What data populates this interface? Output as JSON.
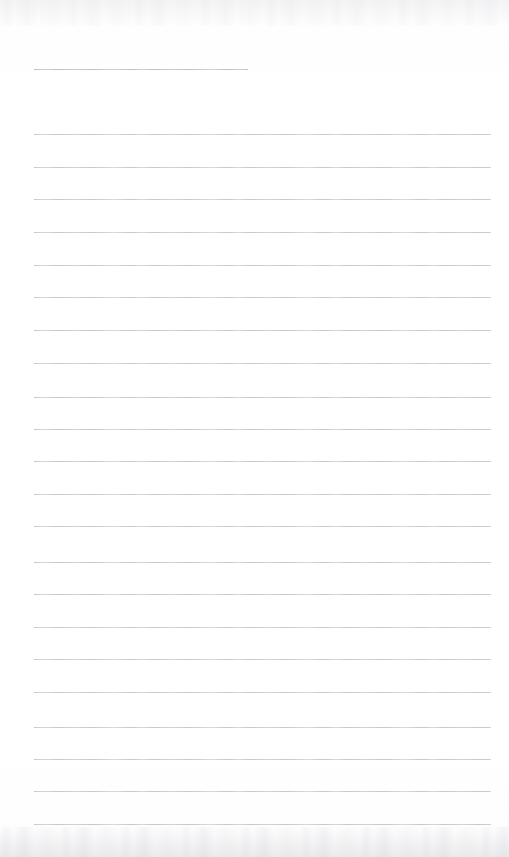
{
  "document": {
    "type": "blank-ruled-notepad-page",
    "description": "Scanned blank lined notepad sheet",
    "page_width": 509,
    "page_height": 857,
    "paper_color": "#fefefe",
    "rule_color": "#b9bcc3",
    "text_content": "",
    "has_handwriting": false,
    "has_printed_text": false
  },
  "ruling": {
    "left_margin_x": 34,
    "right_margin_x": 491,
    "line_count": 24,
    "line_spacing": 32.4,
    "title_line": {
      "label": "title-rule",
      "y": 69,
      "x_start": 34,
      "x_end": 248
    },
    "body_lines": [
      {
        "y": 134,
        "x_start": 34,
        "x_end": 491
      },
      {
        "y": 167,
        "x_start": 34,
        "x_end": 491
      },
      {
        "y": 199,
        "x_start": 34,
        "x_end": 491
      },
      {
        "y": 232,
        "x_start": 34,
        "x_end": 491
      },
      {
        "y": 265,
        "x_start": 34,
        "x_end": 491
      },
      {
        "y": 297,
        "x_start": 34,
        "x_end": 491
      },
      {
        "y": 330,
        "x_start": 34,
        "x_end": 491
      },
      {
        "y": 363,
        "x_start": 34,
        "x_end": 491
      },
      {
        "y": 397,
        "x_start": 34,
        "x_end": 491
      },
      {
        "y": 429,
        "x_start": 34,
        "x_end": 491
      },
      {
        "y": 461,
        "x_start": 34,
        "x_end": 491
      },
      {
        "y": 494,
        "x_start": 34,
        "x_end": 491
      },
      {
        "y": 526,
        "x_start": 34,
        "x_end": 491
      },
      {
        "y": 562,
        "x_start": 34,
        "x_end": 491
      },
      {
        "y": 594,
        "x_start": 34,
        "x_end": 491
      },
      {
        "y": 627,
        "x_start": 34,
        "x_end": 491
      },
      {
        "y": 659,
        "x_start": 34,
        "x_end": 491
      },
      {
        "y": 692,
        "x_start": 34,
        "x_end": 491
      },
      {
        "y": 727,
        "x_start": 34,
        "x_end": 491
      },
      {
        "y": 759,
        "x_start": 34,
        "x_end": 491
      },
      {
        "y": 791,
        "x_start": 34,
        "x_end": 491
      },
      {
        "y": 824,
        "x_start": 34,
        "x_end": 491
      }
    ]
  },
  "scan_artifacts": {
    "top_band_height": 26,
    "bottom_band_height": 30,
    "noise_color": "#a9acb3"
  }
}
